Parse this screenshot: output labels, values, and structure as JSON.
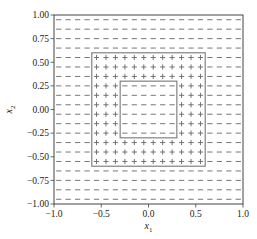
{
  "chart_data": {
    "type": "scatter",
    "title": "",
    "xlabel": "x_1",
    "ylabel": "x_2",
    "xlabel_display": "x",
    "xlabel_sub": "1",
    "ylabel_display": "x",
    "ylabel_sub": "2",
    "xlim": [
      -1.0,
      1.0
    ],
    "ylim": [
      -1.0,
      1.0
    ],
    "xticks": [
      -1.0,
      -0.5,
      0.0,
      0.5,
      1.0
    ],
    "xtick_labels": [
      "−1.0",
      "−0.5",
      "0.0",
      "0.5",
      "1.0"
    ],
    "yticks": [
      -1.0,
      -0.75,
      -0.5,
      -0.25,
      0.0,
      0.25,
      0.5,
      0.75,
      1.0
    ],
    "ytick_labels": [
      "−1.00",
      "−0.75",
      "−0.50",
      "−0.25",
      "0.00",
      "0.25",
      "0.50",
      "0.75",
      "1.00"
    ],
    "grid": false,
    "legend": null,
    "marker_grid": {
      "start": -0.95,
      "stop": 0.95,
      "step": 0.1,
      "count_per_axis": 20
    },
    "rule": "marker '+' where 0.3 <= max(|x1|,|x2|) < 0.6, otherwise '-'",
    "regions": [
      {
        "name": "outer-square",
        "bounds": [
          -0.6,
          0.6
        ],
        "label": "+ ring between 0.3 and 0.6"
      },
      {
        "name": "inner-square",
        "bounds": [
          -0.3,
          0.3
        ],
        "label": "- inside"
      }
    ],
    "series": [
      {
        "name": "positive",
        "marker": "+",
        "description": "points in square annulus 0.3 <= max(|x1|,|x2|) < 0.6"
      },
      {
        "name": "negative",
        "marker": "-",
        "description": "points with max(|x1|,|x2|) < 0.3 or >= 0.6"
      }
    ]
  },
  "colors": {
    "marker": "#666666",
    "axis": "#444444",
    "boundary": "#777777",
    "text": "#222222"
  }
}
